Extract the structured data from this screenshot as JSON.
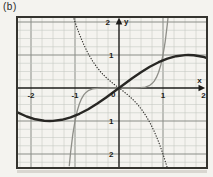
{
  "figure_label": "(b)",
  "colors": {
    "bg": "#f4f3ef",
    "grid_minor": "#c3c6c1",
    "grid_major": "#8a8d87",
    "frame": "#35342f",
    "axis": "#1d1c1a",
    "text": "#1d1c1a",
    "shadow": "#d9d6d0",
    "curve_thick": "#282724",
    "curve_thin": "#8f8f89",
    "curve_dotted": "#32312d"
  },
  "chart_data": {
    "type": "line",
    "title": "",
    "axes": {
      "x_label": "x",
      "y_label": "y",
      "origin_label": "0",
      "xlim": [
        -2.32,
        2.0
      ],
      "ylim": [
        -2.42,
        2.15
      ],
      "grid": "minor every 0.25, major every 1.0",
      "x_ticks": [
        {
          "value": -2,
          "label": "-2"
        },
        {
          "value": -1,
          "label": "-1"
        },
        {
          "value": 1,
          "label": "1"
        },
        {
          "value": 2,
          "label": "2"
        }
      ],
      "y_ticks": [
        {
          "value": 2,
          "label": "2"
        },
        {
          "value": 1,
          "label": "1"
        },
        {
          "value": -1,
          "label": "1"
        },
        {
          "value": -2,
          "label": "2"
        }
      ]
    },
    "series": [
      {
        "name": "thin-solid-steep-odd-curve",
        "style": "thin",
        "points": [
          [
            -1.13,
            -2.35
          ],
          [
            -1.1,
            -1.949
          ],
          [
            -1.05,
            -1.407
          ],
          [
            -1.0,
            -1.0
          ],
          [
            -0.95,
            -0.698
          ],
          [
            -0.9,
            -0.478
          ],
          [
            -0.85,
            -0.321
          ],
          [
            -0.8,
            -0.21
          ],
          [
            -0.75,
            -0.133
          ],
          [
            -0.7,
            -0.082
          ],
          [
            -0.6,
            -0.028
          ],
          [
            -0.5,
            -0.008
          ],
          [
            -0.4,
            -0.002
          ],
          [
            -0.2,
            0
          ],
          [
            0.2,
            0
          ],
          [
            0.4,
            0.002
          ],
          [
            0.5,
            0.008
          ],
          [
            0.6,
            0.028
          ],
          [
            0.7,
            0.082
          ],
          [
            0.75,
            0.133
          ],
          [
            0.8,
            0.21
          ],
          [
            0.85,
            0.321
          ],
          [
            0.9,
            0.478
          ],
          [
            0.95,
            0.698
          ],
          [
            1.0,
            1.0
          ],
          [
            1.05,
            1.407
          ],
          [
            1.1,
            1.949
          ],
          [
            1.13,
            2.35
          ]
        ]
      },
      {
        "name": "dotted-cubic-curve",
        "style": "dotted",
        "points": [
          [
            -1.06,
            2.251
          ],
          [
            -1.0,
            2.0
          ],
          [
            -0.9,
            1.629
          ],
          [
            -0.8,
            1.312
          ],
          [
            -0.7,
            1.043
          ],
          [
            -0.6,
            0.816
          ],
          [
            -0.5,
            0.625
          ],
          [
            -0.4,
            0.464
          ],
          [
            -0.3,
            0.327
          ],
          [
            -0.2,
            0.208
          ],
          [
            -0.1,
            0.101
          ],
          [
            0,
            0
          ],
          [
            0.1,
            -0.101
          ],
          [
            0.2,
            -0.208
          ],
          [
            0.3,
            -0.327
          ],
          [
            0.4,
            -0.464
          ],
          [
            0.5,
            -0.625
          ],
          [
            0.6,
            -0.816
          ],
          [
            0.7,
            -1.043
          ],
          [
            0.8,
            -1.312
          ],
          [
            0.9,
            -1.629
          ],
          [
            1.0,
            -2.0
          ],
          [
            1.1,
            -2.431
          ],
          [
            1.14,
            -2.62
          ]
        ]
      },
      {
        "name": "thick-sine-curve",
        "style": "thick",
        "points": [
          [
            -2.32,
            -0.732
          ],
          [
            -2.1,
            -0.863
          ],
          [
            -1.9,
            -0.947
          ],
          [
            -1.7,
            -0.992
          ],
          [
            -1.57,
            -1.0
          ],
          [
            -1.5,
            -0.997
          ],
          [
            -1.3,
            -0.964
          ],
          [
            -1.1,
            -0.891
          ],
          [
            -0.9,
            -0.783
          ],
          [
            -0.7,
            -0.644
          ],
          [
            -0.5,
            -0.479
          ],
          [
            -0.3,
            -0.296
          ],
          [
            -0.1,
            -0.1
          ],
          [
            0.1,
            0.1
          ],
          [
            0.3,
            0.296
          ],
          [
            0.5,
            0.479
          ],
          [
            0.7,
            0.644
          ],
          [
            0.9,
            0.783
          ],
          [
            1.1,
            0.891
          ],
          [
            1.3,
            0.964
          ],
          [
            1.5,
            0.997
          ],
          [
            1.57,
            1.0
          ],
          [
            1.7,
            0.992
          ],
          [
            1.9,
            0.947
          ],
          [
            2.0,
            0.909
          ]
        ]
      }
    ]
  }
}
